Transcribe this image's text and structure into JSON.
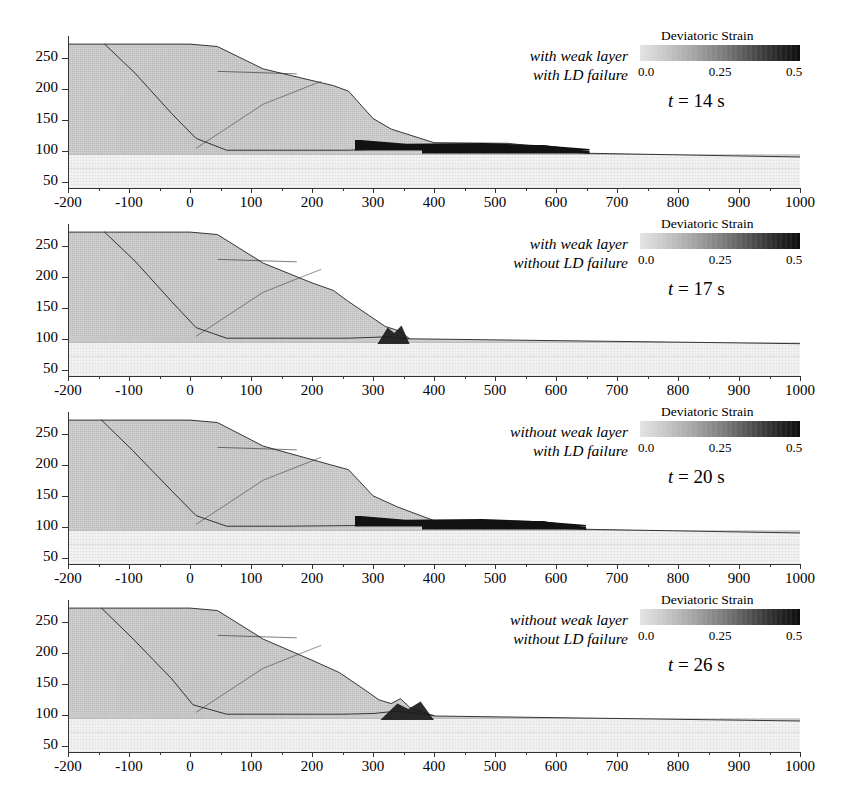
{
  "figure": {
    "panel_count": 4,
    "colorbar": {
      "title": "Deviatoric Strain",
      "ticks": [
        "0.0",
        "0.25",
        "0.5"
      ],
      "min": 0.0,
      "max": 0.5,
      "low_color": "#e3e3e3",
      "high_color": "#0d0d0d"
    },
    "axes": {
      "x_ticks": [
        "-200",
        "-100",
        "0",
        "100",
        "200",
        "300",
        "400",
        "500",
        "600",
        "700",
        "800",
        "900",
        "1000"
      ],
      "y_ticks": [
        "50",
        "100",
        "150",
        "200",
        "250"
      ],
      "xlim": [
        -200,
        1000
      ],
      "ylim": [
        40,
        285
      ]
    }
  },
  "panels": [
    {
      "id": "panel-1",
      "condition_line1": "with weak layer",
      "condition_line2": "with LD failure",
      "time_prefix": "t",
      "time_eq": "=",
      "time_value": "14",
      "time_unit": "s",
      "time_label": "t = 14 s",
      "colorbar_title": "Deviatoric Strain",
      "cb_ticks": [
        "0.0",
        "0.25",
        "0.5"
      ],
      "runout_extent": 655,
      "deposit": "long dark debris runout reaching x = 655"
    },
    {
      "id": "panel-2",
      "condition_line1": "with weak layer",
      "condition_line2": "without LD failure",
      "time_prefix": "t",
      "time_eq": "=",
      "time_value": "17",
      "time_unit": "s",
      "time_label": "t = 17 s",
      "colorbar_title": "Deviatoric Strain",
      "cb_ticks": [
        "0.0",
        "0.25",
        "0.5"
      ],
      "runout_extent": 360,
      "deposit": "mass arrested near x = 360 with toe bulge"
    },
    {
      "id": "panel-3",
      "condition_line1": "without weak layer",
      "condition_line2": "with LD failure",
      "time_prefix": "t",
      "time_eq": "=",
      "time_value": "20",
      "time_unit": "s",
      "time_label": "t = 20 s",
      "colorbar_title": "Deviatoric Strain",
      "cb_ticks": [
        "0.0",
        "0.25",
        "0.5"
      ],
      "runout_extent": 650,
      "deposit": "long dark debris runout reaching x = 650"
    },
    {
      "id": "panel-4",
      "condition_line1": "without weak layer",
      "condition_line2": "without LD failure",
      "time_prefix": "t",
      "time_eq": "=",
      "time_value": "26",
      "time_unit": "s",
      "time_label": "t = 26 s",
      "colorbar_title": "Deviatoric Strain",
      "cb_ticks": [
        "0.0",
        "0.25",
        "0.5"
      ],
      "runout_extent": 400,
      "deposit": "small toe bulge near x = 340, minimal runout"
    }
  ],
  "chart_data": {
    "type": "heatmap",
    "xlabel": "",
    "ylabel": "",
    "xlim": [
      -200,
      1000
    ],
    "ylim": [
      40,
      285
    ],
    "x_ticks": [
      -200,
      -100,
      0,
      100,
      200,
      300,
      400,
      500,
      600,
      700,
      800,
      900,
      1000
    ],
    "y_ticks": [
      50,
      100,
      150,
      200,
      250
    ],
    "grid": false,
    "colorbar": {
      "label": "Deviatoric Strain",
      "vmin": 0.0,
      "vmax": 0.5,
      "ticks": [
        0.0,
        0.25,
        0.5
      ]
    },
    "legend_position": "top-right of each panel",
    "panels": [
      {
        "label": "with weak layer / with LD failure",
        "time_s": 14,
        "crest_elevation": 272,
        "base_elevation": 100,
        "substrate_top": 95,
        "runout_distance": 655,
        "surface_profile_x": [
          -200,
          0,
          45,
          120,
          235,
          260,
          300,
          330,
          400,
          520,
          560,
          620,
          655,
          1000
        ],
        "surface_profile_y": [
          272,
          272,
          268,
          232,
          205,
          196,
          152,
          135,
          113,
          112,
          108,
          100,
          96,
          90
        ],
        "basal_shear_band_x": [
          -140,
          -90,
          -30,
          10,
          60,
          160,
          260,
          340,
          420,
          520,
          620,
          655
        ],
        "basal_shear_band_y": [
          272,
          225,
          160,
          120,
          101,
          101,
          101,
          104,
          101,
          100,
          98,
          96
        ]
      },
      {
        "label": "with weak layer / without LD failure",
        "time_s": 17,
        "crest_elevation": 272,
        "base_elevation": 100,
        "substrate_top": 95,
        "runout_distance": 360,
        "surface_profile_x": [
          -200,
          0,
          45,
          120,
          200,
          235,
          260,
          290,
          320,
          345,
          360,
          1000
        ],
        "surface_profile_y": [
          272,
          272,
          268,
          222,
          190,
          178,
          160,
          140,
          120,
          112,
          100,
          92
        ],
        "basal_shear_band_x": [
          -140,
          -90,
          -30,
          10,
          60,
          160,
          260,
          320,
          360
        ],
        "basal_shear_band_y": [
          272,
          225,
          160,
          118,
          101,
          101,
          101,
          103,
          100
        ]
      },
      {
        "label": "without weak layer / with LD failure",
        "time_s": 20,
        "crest_elevation": 272,
        "base_elevation": 100,
        "substrate_top": 95,
        "runout_distance": 650,
        "surface_profile_x": [
          -200,
          0,
          45,
          120,
          230,
          260,
          300,
          340,
          400,
          500,
          580,
          620,
          650,
          1000
        ],
        "surface_profile_y": [
          272,
          272,
          268,
          230,
          200,
          192,
          150,
          132,
          110,
          110,
          108,
          102,
          96,
          90
        ],
        "basal_shear_band_x": [
          -145,
          -95,
          -30,
          10,
          60,
          160,
          280,
          380,
          470,
          560,
          650
        ],
        "basal_shear_band_y": [
          272,
          224,
          158,
          118,
          101,
          101,
          102,
          103,
          101,
          99,
          96
        ]
      },
      {
        "label": "without weak layer / without LD failure",
        "time_s": 26,
        "crest_elevation": 272,
        "base_elevation": 100,
        "substrate_top": 95,
        "runout_distance": 400,
        "surface_profile_x": [
          -200,
          0,
          45,
          120,
          200,
          245,
          275,
          310,
          330,
          345,
          360,
          400,
          1000
        ],
        "surface_profile_y": [
          272,
          272,
          268,
          222,
          188,
          168,
          148,
          124,
          118,
          126,
          112,
          98,
          90
        ],
        "basal_shear_band_x": [
          -145,
          -95,
          -30,
          5,
          60,
          160,
          250,
          300,
          340,
          400
        ],
        "basal_shear_band_y": [
          272,
          224,
          158,
          116,
          101,
          101,
          101,
          102,
          106,
          99
        ]
      }
    ]
  }
}
